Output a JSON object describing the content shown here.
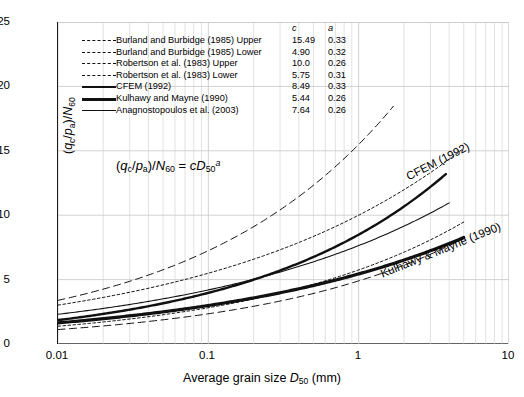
{
  "chart_data": {
    "type": "line",
    "title": "",
    "xlabel": "Average grain size D50 (mm)",
    "ylabel": "(qc/pa)/N60",
    "xscale": "log",
    "xlim": [
      0.01,
      10
    ],
    "ylim": [
      0,
      25
    ],
    "xticks": [
      "0.01",
      "0.1",
      "1",
      "10"
    ],
    "yticks": [
      "0",
      "5",
      "10",
      "15",
      "20",
      "25"
    ],
    "grid": true,
    "legend_position": "upper-left-inside",
    "equation": "(qc/pa)/N60 = c D50^a",
    "model": "y = c * x^a",
    "series": [
      {
        "name": "Burland and Burbidge (1985) Upper",
        "c": 15.49,
        "a": 0.33,
        "style": "dashed",
        "width": 1.0,
        "x": [
          0.01,
          0.02,
          0.05,
          0.1,
          0.2,
          0.5,
          1.0,
          1.7
        ],
        "y": [
          3.39,
          4.26,
          5.71,
          7.18,
          9.03,
          12.1,
          15.49,
          18.4
        ]
      },
      {
        "name": "Burland and Burbidge (1985) Lower",
        "c": 4.9,
        "a": 0.32,
        "style": "dashed",
        "width": 1.0,
        "x": [
          0.01,
          0.02,
          0.05,
          0.1,
          0.2,
          0.5,
          1.0,
          2.0,
          5.0
        ],
        "y": [
          1.11,
          1.39,
          1.84,
          2.3,
          2.87,
          3.8,
          4.9,
          6.12,
          8.11
        ]
      },
      {
        "name": "Robertson et al. (1983) Upper",
        "c": 10.0,
        "a": 0.26,
        "style": "dotted",
        "width": 1.0,
        "x": [
          0.01,
          0.02,
          0.05,
          0.1,
          0.2,
          0.5,
          1.0,
          2.0,
          5.0
        ],
        "y": [
          3.02,
          3.62,
          4.57,
          5.5,
          6.58,
          8.32,
          10.0,
          11.97,
          15.49
        ]
      },
      {
        "name": "Robertson et al. (1983) Lower",
        "c": 5.75,
        "a": 0.31,
        "style": "dotted",
        "width": 1.0,
        "x": [
          0.01,
          0.02,
          0.05,
          0.1,
          0.2,
          0.5,
          1.0,
          2.0,
          5.0
        ],
        "y": [
          1.36,
          1.69,
          2.21,
          2.74,
          3.4,
          4.47,
          5.75,
          7.13,
          9.38
        ]
      },
      {
        "name": "CFEM (1992)",
        "c": 8.49,
        "a": 0.33,
        "style": "solid",
        "width": 2.4,
        "x": [
          0.01,
          0.02,
          0.05,
          0.1,
          0.2,
          0.5,
          1.0,
          2.0,
          3.8
        ],
        "y": [
          1.86,
          2.34,
          3.13,
          3.93,
          4.95,
          6.63,
          8.49,
          10.68,
          13.19
        ]
      },
      {
        "name": "Kulhawy and Mayne (1990)",
        "c": 5.44,
        "a": 0.26,
        "style": "solid",
        "width": 3.2,
        "x": [
          0.01,
          0.02,
          0.05,
          0.1,
          0.2,
          0.5,
          1.0,
          2.0,
          5.0
        ],
        "y": [
          1.64,
          1.97,
          2.49,
          2.99,
          3.58,
          4.53,
          5.44,
          6.51,
          8.43
        ]
      },
      {
        "name": "Anagnostopoulos et al. (2003)",
        "c": 7.64,
        "a": 0.26,
        "style": "solid",
        "width": 1.1,
        "x": [
          0.01,
          0.02,
          0.05,
          0.1,
          0.2,
          0.5,
          1.0,
          2.0,
          4.0
        ],
        "y": [
          2.3,
          2.76,
          3.49,
          4.2,
          5.02,
          6.36,
          7.64,
          9.14,
          10.95
        ]
      }
    ],
    "annotations": [
      {
        "text": "CFEM (1992)",
        "target": "CFEM (1992)"
      },
      {
        "text": "Kulhawy & Mayne (1990)",
        "target": "Kulhawy and Mayne (1990)"
      }
    ]
  },
  "axes": {
    "ylabel_parts": {
      "pre": "(",
      "q": "q",
      "qsub": "c",
      "slash1": "/",
      "p": "p",
      "psub": "a",
      "post": ")/",
      "n": "N",
      "nsub": "60"
    },
    "xlabel_parts": {
      "pre": "Average grain size ",
      "d": "D",
      "dsub": "50",
      "post": " (mm)"
    },
    "yticks": [
      "25",
      "20",
      "15",
      "10",
      "5",
      "0"
    ],
    "xticks": [
      "0.01",
      "0.1",
      "1",
      "10"
    ]
  },
  "equation": {
    "lparen": "(",
    "q": "q",
    "qsub": "c",
    "slash": "/",
    "p": "p",
    "psub": "a",
    "rparen": ")/",
    "n": "N",
    "nsub": "60",
    "eq": " = ",
    "c": "c",
    "d": "D",
    "dsub": "50",
    "dsup": "a"
  },
  "legend": {
    "header_c": "c",
    "header_a": "a",
    "rows": [
      {
        "label": "Burland and Burbidge (1985) Upper",
        "c": "15.49",
        "a": "0.33"
      },
      {
        "label": "Burland and Burbidge (1985) Lower",
        "c": "4.90",
        "a": "0.32"
      },
      {
        "label": "Robertson et al. (1983) Upper",
        "c": "10.0",
        "a": "0.26"
      },
      {
        "label": "Robertson et al. (1983) Lower",
        "c": "5.75",
        "a": "0.31"
      },
      {
        "label": "CFEM (1992)",
        "c": "8.49",
        "a": "0.33"
      },
      {
        "label": "Kulhawy and Mayne (1990)",
        "c": "5.44",
        "a": "0.26"
      },
      {
        "label": "Anagnostopoulos et al. (2003)",
        "c": "7.64",
        "a": "0.26"
      }
    ]
  },
  "curve_labels": {
    "cfem": "CFEM (1992)",
    "kulhawy": "Kulhawy & Mayne (1990)"
  },
  "colors": {
    "line": "#111111",
    "grid": "#c9c9c9",
    "axis": "#1a1a1a",
    "background": "#ffffff"
  }
}
